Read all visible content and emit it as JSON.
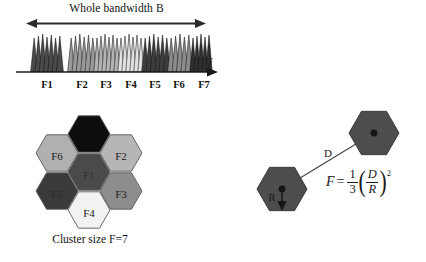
{
  "spectrum": {
    "bandwidth_label": "Whole bandwidth B",
    "axis_symbol": "f",
    "band_labels": [
      "F1",
      "F2",
      "F3",
      "F4",
      "F5",
      "F6",
      "F7"
    ],
    "band_label_x": [
      33,
      68,
      92,
      117,
      141,
      165,
      190
    ],
    "bands": [
      {
        "label": "F1",
        "x": 18,
        "width": 30,
        "color": "#4a4a4a"
      },
      {
        "label": "F2",
        "x": 55,
        "width": 26,
        "color": "#9a9a9a"
      },
      {
        "label": "F3",
        "x": 81,
        "width": 24,
        "color": "#b4b4b4"
      },
      {
        "label": "F4",
        "x": 105,
        "width": 24,
        "color": "#e2e2e2"
      },
      {
        "label": "F5",
        "x": 129,
        "width": 26,
        "color": "#3d3d3d"
      },
      {
        "label": "F6",
        "x": 155,
        "width": 22,
        "color": "#8c8c8c"
      },
      {
        "label": "F7",
        "x": 177,
        "width": 20,
        "color": "#2f2f2f"
      }
    ],
    "axis_color": "#1a1a1a",
    "arrow_color": "#2b2b2b"
  },
  "cluster": {
    "caption": "Cluster size F=7",
    "cells": [
      {
        "label": "F7",
        "cx": 75,
        "cy": 29,
        "fill": "#0d0d0d",
        "text": "#0d0d0d"
      },
      {
        "label": "F6",
        "cx": 43,
        "cy": 48,
        "fill": "#b0b0b0",
        "text": "#202020"
      },
      {
        "label": "F2",
        "cx": 107,
        "cy": 48,
        "fill": "#b6b6b6",
        "text": "#202020"
      },
      {
        "label": "F1",
        "cx": 75,
        "cy": 67,
        "fill": "#4a4a4a",
        "text": "#343434"
      },
      {
        "label": "F5",
        "cx": 43,
        "cy": 86,
        "fill": "#3a3a3a",
        "text": "#2c2c2c"
      },
      {
        "label": "F3",
        "cx": 107,
        "cy": 86,
        "fill": "#8d8d8d",
        "text": "#1f1f1f"
      },
      {
        "label": "F4",
        "cx": 75,
        "cy": 105,
        "fill": "#f2f2f2",
        "text": "#1a1a1a"
      }
    ],
    "hex_radius": 21,
    "stroke": "#5a5a5a"
  },
  "reuse": {
    "distance_label": "D",
    "radius_label": "R",
    "cell_fill": "#4d4d4d",
    "cell_stroke": "#3a3a3a",
    "line_color": "#4a4a4a",
    "formula": {
      "lhs": "F",
      "equals": "=",
      "coefficient_numerator": "1",
      "coefficient_denominator": "3",
      "paren_open": "(",
      "ratio_numerator": "D",
      "ratio_denominator": "R",
      "paren_close": ")",
      "exponent": "2",
      "plain_text": "F = (1/3)(D/R)^2"
    }
  }
}
